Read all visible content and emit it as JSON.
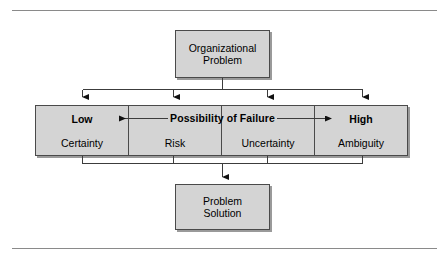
{
  "figure": {
    "title_top": {
      "lines": [
        "Organizational",
        "Problem"
      ]
    },
    "title_bottom": {
      "lines": [
        "Problem",
        "Solution"
      ]
    },
    "spectrum": {
      "axis_label": "Possibility of Failure",
      "low_label": "Low",
      "high_label": "High",
      "segments": [
        {
          "emphasis": "Low",
          "label": "Certainty"
        },
        {
          "emphasis": "",
          "label": "Risk"
        },
        {
          "emphasis": "",
          "label": "Uncertainty"
        },
        {
          "emphasis": "High",
          "label": "Ambiguity"
        }
      ]
    },
    "colors": {
      "box_fill": "#d4d4d4",
      "box_stroke": "#4a4a4a",
      "shadow": "#9a9a9a",
      "rule": "#8a8a8a",
      "text": "#000000"
    }
  }
}
